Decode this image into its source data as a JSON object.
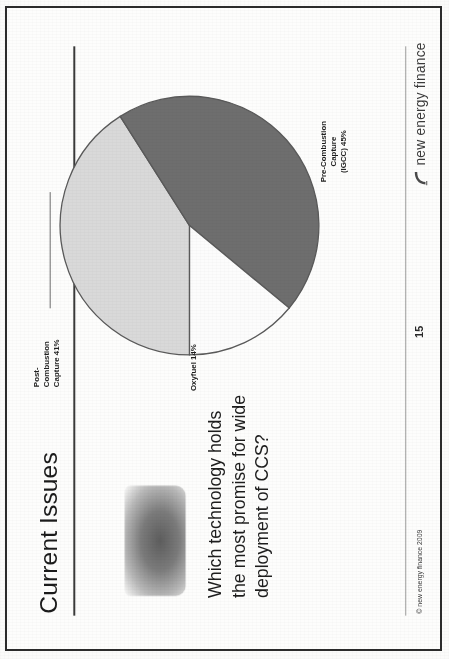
{
  "document": {
    "kind": "scanned-presentation-slide",
    "orientation_note": "slide-rotated-90-ccw-on-page"
  },
  "slide": {
    "title": "Current Issues",
    "page_number": "15",
    "copyright": "© new energy finance 2009",
    "brand": {
      "name": "new energy finance",
      "mark_icon": "nef-swoosh-icon"
    },
    "callout": {
      "shape_icon": "cloud-blob-shape",
      "lines": [
        "Which technology holds",
        "the most promise for wide",
        "deployment of CCS?"
      ]
    }
  },
  "chart_data": {
    "type": "pie",
    "title": "",
    "categories": [
      "Post-Combustion Capture",
      "Pre-Combustion Capture (IGCC)",
      "Oxyfuel"
    ],
    "values": [
      41,
      45,
      14
    ],
    "unit": "%",
    "legend_position": "none-labels-outside",
    "grid": false,
    "labels": [
      {
        "id": "post-combustion",
        "lines": [
          "Post-",
          "Combustion",
          "Capture 41%"
        ],
        "value": 41,
        "color": "#d9d9d9"
      },
      {
        "id": "pre-combustion",
        "lines": [
          "Pre-Combustion",
          "Capture",
          "(IGCC) 45%"
        ],
        "value": 45,
        "color": "#6e6e6e"
      },
      {
        "id": "oxyfuel",
        "lines": [
          "Oxyfuel  14%"
        ],
        "value": 14,
        "color": "#fbfbfb"
      }
    ],
    "colors": {
      "post_combustion": "#d9d9d9",
      "pre_combustion": "#6e6e6e",
      "oxyfuel": "#fcfcfc",
      "outline": "#5a5a5a"
    }
  }
}
